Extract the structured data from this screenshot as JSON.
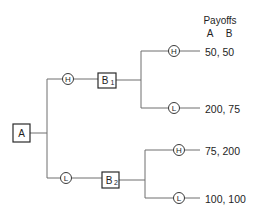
{
  "diagram": {
    "type": "game-tree",
    "header": {
      "title": "Payoffs",
      "col_a": "A",
      "col_b": "B"
    },
    "nodes": {
      "root": {
        "label": "A"
      },
      "b1": {
        "label": "B",
        "sub": "1"
      },
      "b2": {
        "label": "B",
        "sub": "2"
      }
    },
    "moves": {
      "a_high": "H",
      "a_low": "L",
      "b1_high": "H",
      "b1_low": "L",
      "b2_high": "H",
      "b2_low": "L"
    },
    "payoffs": [
      {
        "path": "H-H",
        "value": "50, 50"
      },
      {
        "path": "H-L",
        "value": "200, 75"
      },
      {
        "path": "L-H",
        "value": "75, 200"
      },
      {
        "path": "L-L",
        "value": "100, 100"
      }
    ]
  }
}
